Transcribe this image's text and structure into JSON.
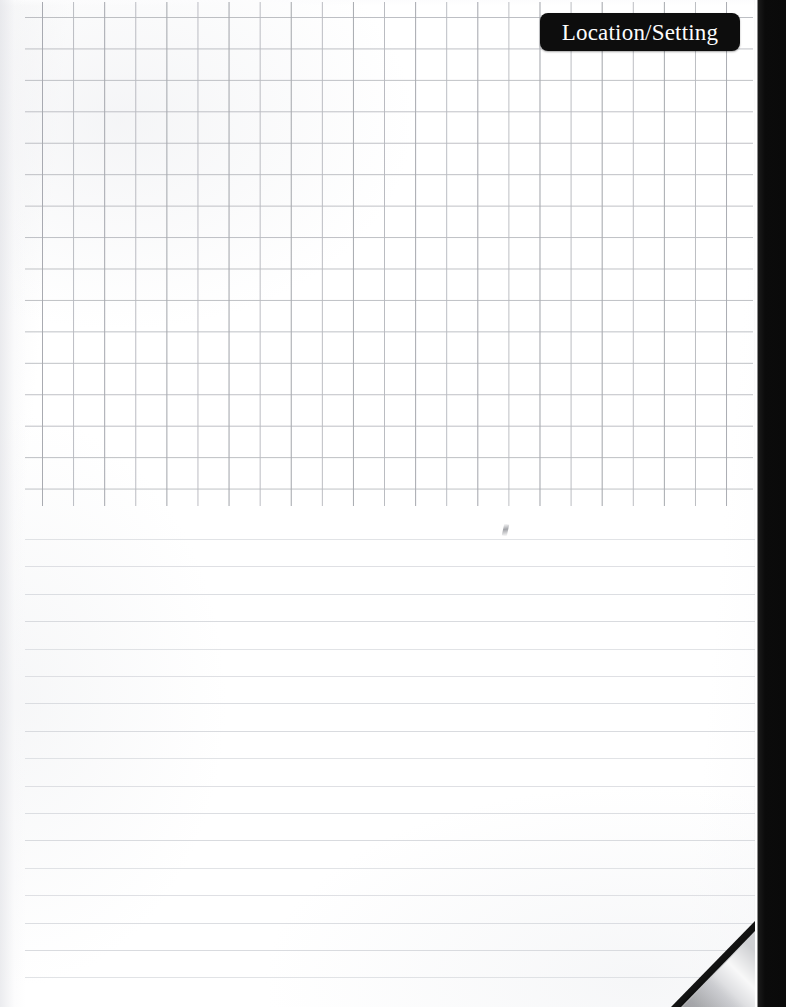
{
  "page": {
    "title": "Location/Setting",
    "paper_color": "#ffffff",
    "width": 786,
    "height": 1007
  },
  "header": {
    "badge": {
      "label": "Location/Setting",
      "background_color": "#0d0d0d",
      "text_color": "#fdfdfd",
      "shape": "rounded-rectangle"
    }
  },
  "grid_section": {
    "name": "squared-graph-area",
    "line_color": "#b3b5bb",
    "cell_size_px": 31,
    "top_px": 2,
    "bottom_px": 506,
    "left_px": 25,
    "right_px": 753,
    "columns": 23,
    "rows": 16
  },
  "ruled_section": {
    "name": "lined-writing-area",
    "line_color": "#d6d8dd",
    "line_spacing_px": 27.4,
    "first_line_y_px": 33,
    "line_count": 17,
    "top_px": 506,
    "bottom_px": 1007
  },
  "binding": {
    "name": "notebook-binding-strip",
    "color": "#0a0a0a",
    "width_px": 31,
    "side": "right"
  },
  "page_curl": {
    "name": "page-corner-curl",
    "corner": "bottom-right",
    "leaf_color": "#cfd0d3",
    "void_color": "#141414",
    "size_px": 84
  },
  "marks": [
    {
      "name": "faint-pencil-mark",
      "x_px": 503,
      "y_px": 524,
      "color": "#84868c"
    }
  ]
}
